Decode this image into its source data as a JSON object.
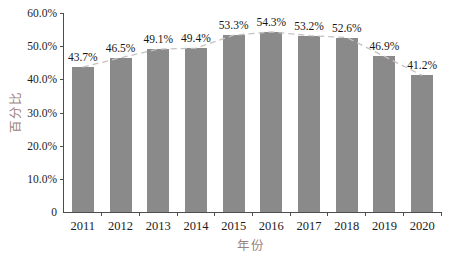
{
  "chart_data": {
    "type": "bar",
    "title": "",
    "categories": [
      "2011",
      "2012",
      "2013",
      "2014",
      "2015",
      "2016",
      "2017",
      "2018",
      "2019",
      "2020"
    ],
    "values": [
      43.7,
      46.5,
      49.1,
      49.4,
      53.3,
      54.3,
      53.2,
      52.6,
      46.9,
      41.2
    ],
    "value_labels": [
      "43.7%",
      "46.5%",
      "49.1%",
      "49.4%",
      "53.3%",
      "54.3%",
      "53.2%",
      "52.6%",
      "46.9%",
      "41.2%"
    ],
    "xlabel": "年份",
    "ylabel": "百分比",
    "ylim": [
      0,
      60
    ],
    "yticks": [
      {
        "value": 0,
        "label": "0"
      },
      {
        "value": 10,
        "label": "10.0%"
      },
      {
        "value": 20,
        "label": "20.0%"
      },
      {
        "value": 30,
        "label": "30.0%"
      },
      {
        "value": 40,
        "label": "40.0%"
      },
      {
        "value": 50,
        "label": "50.0%"
      },
      {
        "value": 60,
        "label": "60.0%"
      }
    ],
    "grid": false,
    "legend": "none",
    "trendline": {
      "style": "dashed",
      "follows": "bar-tops"
    },
    "colors": {
      "bar": "#8a8a8a",
      "trend_line": "#c7c1bf",
      "axis_line": "#4d4d4d",
      "tick_text": "#1c1c1c",
      "value_text": "#161616",
      "axis_title_text": "#9b837c",
      "background": "#ffffff"
    }
  }
}
